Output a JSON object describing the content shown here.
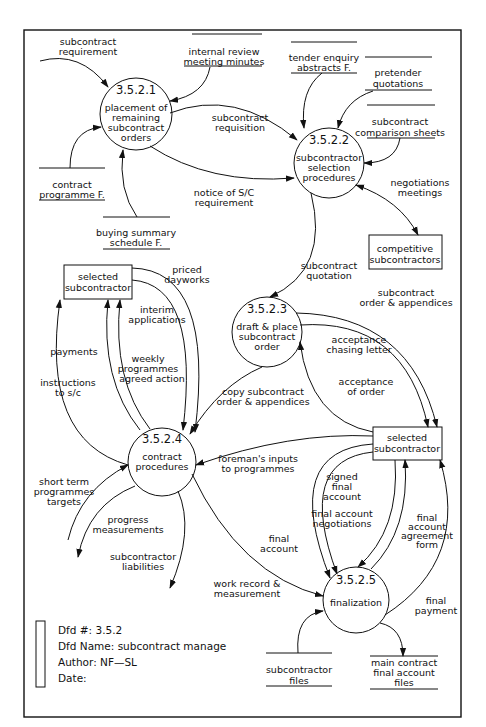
{
  "diagram": {
    "type": "data-flow-diagram",
    "processes": [
      {
        "id": "3.5.2.1",
        "line1": "placement of",
        "line2": "remaining",
        "line3": "subcontract",
        "line4": "orders"
      },
      {
        "id": "3.5.2.2",
        "line1": "subcontractor",
        "line2": "selection",
        "line3": "procedures"
      },
      {
        "id": "3.5.2.3",
        "line1": "draft & place",
        "line2": "subcontract",
        "line3": "order"
      },
      {
        "id": "3.5.2.4",
        "line1": "contract",
        "line2": "procedures"
      },
      {
        "id": "3.5.2.5",
        "line1": "finalization"
      }
    ],
    "external_entities": [
      {
        "line1": "selected",
        "line2": "subcontractor"
      },
      {
        "line1": "competitive",
        "line2": "subcontractors"
      },
      {
        "line1": "selected",
        "line2": "subcontractor"
      }
    ],
    "data_stores": [
      {
        "line1": "internal review",
        "line2": "meeting minutes"
      },
      {
        "line1": "tender enquiry",
        "line2": "abstracts F."
      },
      {
        "line1": "pretender",
        "line2": "quotations"
      },
      {
        "line1": "subcontract",
        "line2": "comparison sheets"
      },
      {
        "line1": "contract",
        "line2": "programme F."
      },
      {
        "line1": "buying summary",
        "line2": "schedule F."
      },
      {
        "line1": "subcontractor",
        "line2": "files"
      },
      {
        "line1": "main contract",
        "line2": "final account",
        "line3": "files"
      }
    ],
    "flows": [
      {
        "line1": "subcontract",
        "line2": "requirement"
      },
      {
        "line1": "subcontract",
        "line2": "requisition"
      },
      {
        "line1": "notice of S/C",
        "line2": "requirement"
      },
      {
        "line1": "negotiations",
        "line2": "meetings"
      },
      {
        "line1": "subcontract",
        "line2": "quotation"
      },
      {
        "line1": "priced",
        "line2": "dayworks"
      },
      {
        "line1": "interim",
        "line2": "applications"
      },
      {
        "line1": "weekly",
        "line2": "programmes",
        "line3": "agreed action"
      },
      {
        "line1": "payments"
      },
      {
        "line1": "instructions",
        "line2": "to s/c"
      },
      {
        "line1": "subcontract",
        "line2": "order & appendices"
      },
      {
        "line1": "acceptance",
        "line2": "chasing letter"
      },
      {
        "line1": "acceptance",
        "line2": "of order"
      },
      {
        "line1": "copy subcontract",
        "line2": "order & appendices"
      },
      {
        "line1": "foreman's inputs",
        "line2": "to programmes"
      },
      {
        "line1": "short term",
        "line2": "programmes",
        "line3": "targets"
      },
      {
        "line1": "progress",
        "line2": "measurements"
      },
      {
        "line1": "subcontractor",
        "line2": "liabilities"
      },
      {
        "line1": "work record &",
        "line2": "measurement"
      },
      {
        "line1": "signed",
        "line2": "final",
        "line3": "account"
      },
      {
        "line1": "final account",
        "line2": "negotiations"
      },
      {
        "line1": "final",
        "line2": "account",
        "line3": "agreement",
        "line4": "form"
      },
      {
        "line1": "final",
        "line2": "account"
      },
      {
        "line1": "final",
        "line2": "payment"
      }
    ]
  },
  "footer": {
    "dfd_number": "Dfd #: 3.5.2",
    "dfd_name": "Dfd Name: subcontract manage",
    "author": "Author: NF—SL",
    "date": "Date:"
  }
}
